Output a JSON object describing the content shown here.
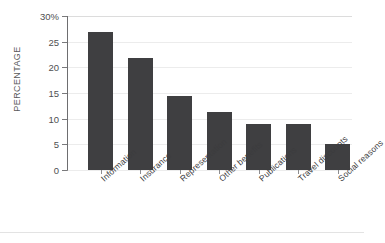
{
  "chart_data": {
    "type": "bar",
    "title": "",
    "xlabel": "",
    "ylabel": "PERCENTAGE",
    "categories": [
      "Information",
      "Insurance",
      "Representation",
      "Other benefits",
      "Publications",
      "Travel discounts",
      "Social reasons"
    ],
    "values": [
      26.8,
      21.8,
      14.5,
      11.3,
      9.0,
      9.0,
      5.0
    ],
    "ylim": [
      0,
      30
    ],
    "yticks": [
      0,
      5,
      10,
      15,
      20,
      25,
      30
    ],
    "ytick_labels": [
      "0",
      "5",
      "10",
      "15",
      "20",
      "25",
      "30%"
    ],
    "grid": true,
    "legend": "none",
    "bar_color": "#3f3f41",
    "gridline_color": "#ececec",
    "axis_color": "#6e6e70",
    "text_color": "#4f4f51"
  }
}
